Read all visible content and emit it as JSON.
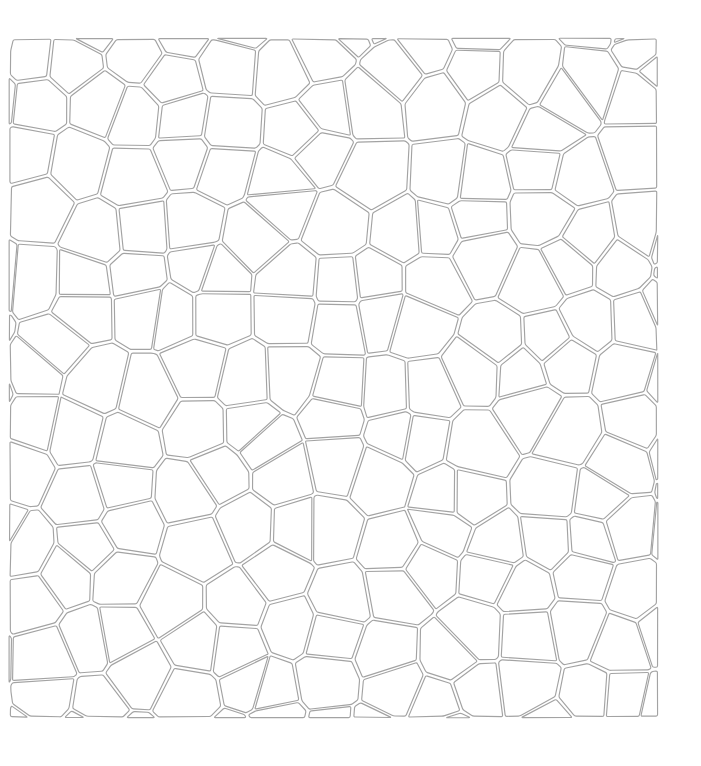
{
  "canvas": {
    "width": 701,
    "height": 766,
    "background_color": "#ffffff"
  },
  "figure": {
    "type": "voronoi-mosaic",
    "title": "",
    "stroke_color": "#a3a3a3",
    "fill_color": "#ffffff",
    "stroke_width": 1.15,
    "cell_inset": 2.0,
    "corner_rounding": 1.5,
    "clip_region": {
      "x": 9,
      "y": 38,
      "width": 649,
      "height": 680
    },
    "grid": {
      "columns": 13,
      "rows": 13,
      "jitter": 0.38,
      "seed": 20240517
    },
    "approx_cell_count": 169
  }
}
